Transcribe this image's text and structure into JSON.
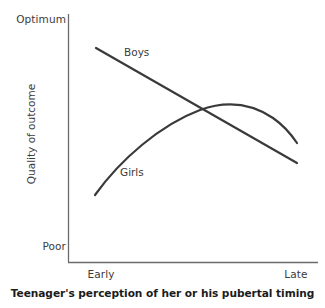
{
  "chart_data": {
    "type": "line",
    "title": "",
    "subtitle": "",
    "xlabel": "Teenager's perception of her or his pubertal timing",
    "ylabel": "Quality of outcome",
    "x_tick_labels": [
      "Early",
      "Late"
    ],
    "y_tick_labels": [
      "Optimum",
      "Poor"
    ],
    "xlim": [
      "Early",
      "Late"
    ],
    "ylim": [
      "Poor",
      "Optimum"
    ],
    "grid": false,
    "legend_position": "inline-annotation",
    "axis_style": "left-and-bottom-spines-only",
    "line_color": "#3a3a3a",
    "line_width": 2.2,
    "series": [
      {
        "name": "Boys",
        "shape": "straight-decreasing-line",
        "label": "Boys",
        "points": [
          {
            "x": 0.1,
            "y": 0.84
          },
          {
            "x": 1.0,
            "y": 0.39
          }
        ],
        "path": "M 96 48 L 297 163"
      },
      {
        "name": "Girls",
        "shape": "inverted-u-curve",
        "label": "Girls",
        "points": [
          {
            "x": 0.09,
            "y": 0.26
          },
          {
            "x": 0.3,
            "y": 0.5
          },
          {
            "x": 0.5,
            "y": 0.62
          },
          {
            "x": 0.7,
            "y": 0.67
          },
          {
            "x": 0.82,
            "y": 0.665
          },
          {
            "x": 1.0,
            "y": 0.48
          }
        ],
        "path": "M 95 195 C 120 160 160 125 200 110 C 228 100 252 104 273 118 C 283 125 291 134 297 143"
      }
    ],
    "annotations": [
      {
        "text": "Boys",
        "x": 124,
        "y": 52
      },
      {
        "text": "Girls",
        "x": 120,
        "y": 172
      }
    ]
  },
  "axes": {
    "y_top_label": "Optimum",
    "y_bottom_label": "Poor",
    "y_title": "Quality of outcome",
    "x_left_label": "Early",
    "x_right_label": "Late",
    "x_title": "Teenager's perception of her or his pubertal timing"
  },
  "series_labels": {
    "boys": "Boys",
    "girls": "Girls"
  },
  "colors": {
    "line": "#3a3a3a",
    "axis": "#6b6b6b",
    "text": "#3b3b3b",
    "title_text": "#1b1b1b",
    "background": "#ffffff"
  }
}
